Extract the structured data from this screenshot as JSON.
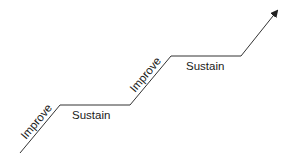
{
  "diagram": {
    "type": "staircase-improvement-cycle",
    "line_color": "#222222",
    "labels": [
      {
        "text": "Improve",
        "role": "rising-step-1"
      },
      {
        "text": "Sustain",
        "role": "plateau-1"
      },
      {
        "text": "Improve",
        "role": "rising-step-2"
      },
      {
        "text": "Sustain",
        "role": "plateau-2"
      }
    ],
    "ending": "arrow-up-right"
  }
}
